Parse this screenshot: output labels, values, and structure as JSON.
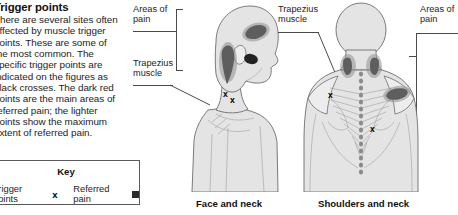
{
  "article": {
    "title": "Trigger points",
    "body": "There are several sites often affected by muscle trigger points. These are some of the most common. The specific trigger points are indicated on the figures as black crosses. The dark red points are the main areas of referred pain; the lighter points show the maximum extent of referred pain."
  },
  "key": {
    "title": "Key",
    "trigger_label": "Trigger points",
    "trigger_symbol": "x",
    "referred_label": "Referred pain",
    "referred_symbol": "square-marker"
  },
  "figures": [
    {
      "id": "face-and-neck",
      "caption": "Face and neck",
      "annotations": [
        {
          "id": "areas-of-pain-left",
          "text": "Areas of\npain"
        },
        {
          "id": "trapezius-muscle-left",
          "text": "Trapezius\nmuscle"
        }
      ],
      "trigger_point_count": 2
    },
    {
      "id": "shoulders-and-neck",
      "caption": "Shoulders and neck",
      "annotations": [
        {
          "id": "trapezius-muscle-right",
          "text": "Trapezius\nmuscle"
        },
        {
          "id": "areas-of-pain-right",
          "text": "Areas of\npain"
        }
      ],
      "trigger_point_count": 2
    }
  ],
  "colors": {
    "pain_dark": "#232323",
    "pain_light": "#8f8f8f",
    "skin": "#e4e4e4",
    "outline": "#6d6d6d",
    "key_border": "#5a5a5a"
  }
}
